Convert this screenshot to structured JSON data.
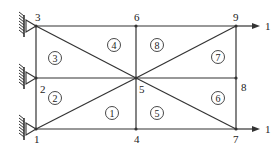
{
  "diagram": {
    "type": "finite-element-mesh",
    "nodes": [
      {
        "id": "1",
        "label": "1",
        "x": 36,
        "y": 129,
        "lx": 34,
        "ly": 143
      },
      {
        "id": "2",
        "label": "2",
        "x": 36,
        "y": 78,
        "lx": 40,
        "ly": 93
      },
      {
        "id": "3",
        "label": "3",
        "x": 36,
        "y": 26,
        "lx": 35,
        "ly": 21
      },
      {
        "id": "4",
        "label": "4",
        "x": 136,
        "y": 129,
        "lx": 134,
        "ly": 143
      },
      {
        "id": "5",
        "label": "5",
        "x": 136,
        "y": 78,
        "lx": 139,
        "ly": 93
      },
      {
        "id": "6",
        "label": "6",
        "x": 136,
        "y": 26,
        "lx": 134,
        "ly": 21
      },
      {
        "id": "7",
        "label": "7",
        "x": 236,
        "y": 129,
        "lx": 233,
        "ly": 143
      },
      {
        "id": "8",
        "label": "8",
        "x": 236,
        "y": 78,
        "lx": 241,
        "ly": 91
      },
      {
        "id": "9",
        "label": "9",
        "x": 236,
        "y": 26,
        "lx": 233,
        "ly": 21
      }
    ],
    "edges": [
      [
        "1",
        "4"
      ],
      [
        "4",
        "7"
      ],
      [
        "2",
        "5"
      ],
      [
        "5",
        "8"
      ],
      [
        "3",
        "6"
      ],
      [
        "6",
        "9"
      ],
      [
        "1",
        "2"
      ],
      [
        "2",
        "3"
      ],
      [
        "4",
        "5"
      ],
      [
        "5",
        "6"
      ],
      [
        "7",
        "8"
      ],
      [
        "8",
        "9"
      ],
      [
        "1",
        "5"
      ],
      [
        "5",
        "9"
      ],
      [
        "3",
        "5"
      ],
      [
        "5",
        "7"
      ]
    ],
    "elements": [
      {
        "label": "1",
        "x": 112,
        "y": 113
      },
      {
        "label": "2",
        "x": 55,
        "y": 98
      },
      {
        "label": "3",
        "x": 55,
        "y": 58
      },
      {
        "label": "4",
        "x": 114,
        "y": 45
      },
      {
        "label": "5",
        "x": 157,
        "y": 113
      },
      {
        "label": "6",
        "x": 218,
        "y": 98
      },
      {
        "label": "7",
        "x": 218,
        "y": 57
      },
      {
        "label": "8",
        "x": 157,
        "y": 45
      }
    ],
    "supports": [
      {
        "node": "1",
        "type": "pin"
      },
      {
        "node": "2",
        "type": "pin"
      },
      {
        "node": "3",
        "type": "pin"
      }
    ],
    "loads": [
      {
        "node": "9",
        "direction": "right",
        "label": "1"
      },
      {
        "node": "7",
        "direction": "right",
        "label": "1"
      }
    ],
    "colors": {
      "line": "#333333",
      "background": "#ffffff"
    }
  }
}
